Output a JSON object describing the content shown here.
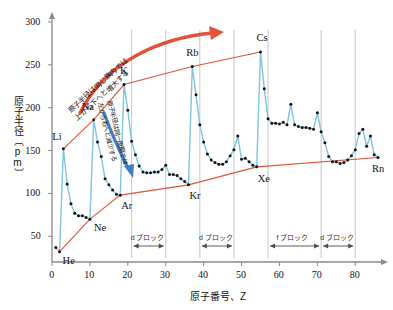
{
  "chart_data": {
    "type": "line",
    "title": "",
    "xlabel": "原子番号、Z",
    "ylabel": "原子半径〔pm〕",
    "xlim": [
      0,
      86
    ],
    "ylim": [
      20,
      300
    ],
    "xticks": [
      0,
      10,
      20,
      30,
      40,
      50,
      60,
      70,
      80
    ],
    "yticks": [
      50,
      100,
      150,
      200,
      250,
      300
    ],
    "grid": false,
    "legend": null,
    "series": [
      {
        "name": "原子半径",
        "color": "#7fc4e0",
        "marker_color": "#111111",
        "x": [
          1,
          2,
          3,
          4,
          5,
          6,
          7,
          8,
          9,
          10,
          11,
          12,
          13,
          14,
          15,
          16,
          17,
          18,
          19,
          20,
          21,
          22,
          23,
          24,
          25,
          26,
          27,
          28,
          29,
          30,
          31,
          32,
          33,
          34,
          35,
          36,
          37,
          38,
          39,
          40,
          41,
          42,
          43,
          44,
          45,
          46,
          47,
          48,
          49,
          50,
          51,
          52,
          53,
          54,
          55,
          56,
          57,
          58,
          59,
          60,
          61,
          62,
          63,
          64,
          65,
          66,
          67,
          68,
          69,
          70,
          71,
          72,
          73,
          74,
          75,
          76,
          77,
          78,
          79,
          80,
          81,
          82,
          83,
          84,
          85,
          86
        ],
        "y": [
          37,
          32,
          152,
          111,
          88,
          77,
          74,
          74,
          72,
          70,
          186,
          160,
          143,
          117,
          110,
          104,
          99,
          98,
          227,
          197,
          161,
          145,
          132,
          125,
          124,
          124,
          125,
          125,
          128,
          133,
          122,
          122,
          121,
          117,
          114,
          110,
          248,
          215,
          180,
          160,
          146,
          139,
          136,
          134,
          134,
          137,
          144,
          151,
          167,
          140,
          141,
          137,
          133,
          131,
          265,
          222,
          187,
          182,
          182,
          181,
          183,
          180,
          204,
          180,
          178,
          177,
          177,
          176,
          175,
          194,
          172,
          159,
          143,
          137,
          137,
          135,
          136,
          139,
          144,
          151,
          170,
          175,
          155,
          167,
          145,
          142
        ]
      },
      {
        "name": "アルカリ金属 上包絡線",
        "color": "#e2523a",
        "x": [
          3,
          11,
          19,
          37,
          55
        ],
        "y": [
          152,
          186,
          227,
          248,
          265
        ]
      },
      {
        "name": "貴ガス 下包絡線",
        "color": "#e2523a",
        "x": [
          2,
          10,
          18,
          36,
          54,
          86
        ],
        "y": [
          32,
          70,
          98,
          110,
          131,
          142
        ]
      }
    ],
    "point_labels": [
      {
        "text": "Li",
        "x": 3,
        "y": 152,
        "dx": -11,
        "dy": -12
      },
      {
        "text": "Na",
        "x": 11,
        "y": 186,
        "dx": -12,
        "dy": -13
      },
      {
        "text": "K",
        "x": 19,
        "y": 227,
        "dx": -4,
        "dy": -14
      },
      {
        "text": "Rb",
        "x": 37,
        "y": 248,
        "dx": -6,
        "dy": -14
      },
      {
        "text": "Cs",
        "x": 55,
        "y": 265,
        "dx": -4,
        "dy": -14
      },
      {
        "text": "He",
        "x": 2,
        "y": 32,
        "dx": 3,
        "dy": 9
      },
      {
        "text": "Ne",
        "x": 10,
        "y": 70,
        "dx": 4,
        "dy": 9
      },
      {
        "text": "Ar",
        "x": 18,
        "y": 98,
        "dx": 1,
        "dy": 11
      },
      {
        "text": "Kr",
        "x": 36,
        "y": 110,
        "dx": 1,
        "dy": 11
      },
      {
        "text": "Xe",
        "x": 54,
        "y": 131,
        "dx": 1,
        "dy": 12
      },
      {
        "text": "Rn",
        "x": 86,
        "y": 142,
        "dx": -6,
        "dy": 12
      }
    ],
    "blocks": [
      {
        "label": "d ブロック",
        "x_start": 21,
        "x_end": 30
      },
      {
        "label": "d ブロック",
        "x_start": 39,
        "x_end": 48
      },
      {
        "label": "f ブロック",
        "x_start": 57,
        "x_end": 71
      },
      {
        "label": "d ブロック",
        "x_start": 71,
        "x_end": 80
      }
    ],
    "annotations": [
      {
        "id": "group-trend",
        "lines": [
          "原子半径は同じ族内では",
          "上から下へと増大する"
        ],
        "color": "#111111",
        "arrow_color": "#e2523a",
        "direction": "上から下へ増大"
      },
      {
        "id": "period-trend",
        "lines": [
          "原子半径は同一周期では",
          "左から右へと減少する"
        ],
        "color": "#111111",
        "arrow_color": "#3f7fc4",
        "direction": "左から右へ減少"
      }
    ],
    "axis_color": "#8a8a8a",
    "block_rule_color": "#b8b8b8"
  }
}
